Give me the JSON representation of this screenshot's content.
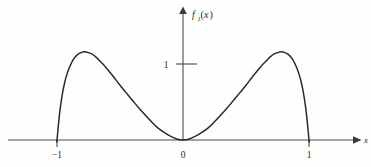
{
  "figure": {
    "y_axis_label": "f",
    "y_axis_label_subscript": "1",
    "y_axis_label_arg_open": "(",
    "y_axis_label_arg": "x",
    "y_axis_label_arg_close": ")",
    "x_axis_label": "x",
    "origin_label": "0",
    "x_tick_left_label": "−1",
    "x_tick_right_label": "1",
    "y_tick_label": "1",
    "curve_color": "#2b2b2b",
    "axis_color": "#4a4a4a",
    "background_color": "#fefefe"
  },
  "chart_data": {
    "type": "line",
    "title": "",
    "xlabel": "x",
    "ylabel": "f_1(x)",
    "grid": false,
    "legend": false,
    "xlim": [
      -1.35,
      1.35
    ],
    "ylim": [
      0,
      1.55
    ],
    "xticks": [
      -1,
      0,
      1
    ],
    "xticklabels": [
      "−1",
      "0",
      "1"
    ],
    "yticks": [
      1
    ],
    "yticklabels": [
      "1"
    ],
    "annotations": [],
    "series": [
      {
        "name": "f_1(x)",
        "comment": "Zero outside [-1,1]; vanishes at x=0 and rises to ~1.15 near x=+/-0.75; drops abruptly to 0 at x=+/-1",
        "x": [
          -1.35,
          -1.001,
          -1.0,
          -0.98,
          -0.96,
          -0.94,
          -0.92,
          -0.9,
          -0.87,
          -0.84,
          -0.81,
          -0.78,
          -0.75,
          -0.72,
          -0.69,
          -0.66,
          -0.63,
          -0.6,
          -0.55,
          -0.5,
          -0.45,
          -0.4,
          -0.35,
          -0.3,
          -0.25,
          -0.2,
          -0.15,
          -0.1,
          -0.05,
          0.0,
          0.05,
          0.1,
          0.15,
          0.2,
          0.25,
          0.3,
          0.35,
          0.4,
          0.45,
          0.5,
          0.55,
          0.6,
          0.63,
          0.66,
          0.69,
          0.72,
          0.75,
          0.78,
          0.81,
          0.84,
          0.87,
          0.9,
          0.92,
          0.94,
          0.96,
          0.98,
          1.0,
          1.001,
          1.35
        ],
        "y": [
          0.0,
          0.0,
          0.0,
          0.34,
          0.58,
          0.75,
          0.87,
          0.96,
          1.06,
          1.12,
          1.15,
          1.16,
          1.15,
          1.13,
          1.09,
          1.04,
          0.99,
          0.93,
          0.83,
          0.72,
          0.62,
          0.52,
          0.42,
          0.33,
          0.24,
          0.16,
          0.1,
          0.05,
          0.013,
          0.0,
          0.013,
          0.05,
          0.1,
          0.16,
          0.24,
          0.33,
          0.42,
          0.52,
          0.62,
          0.72,
          0.83,
          0.93,
          0.99,
          1.04,
          1.09,
          1.13,
          1.15,
          1.16,
          1.15,
          1.12,
          1.06,
          0.96,
          0.87,
          0.75,
          0.58,
          0.34,
          0.0,
          0.0,
          0.0
        ]
      }
    ]
  }
}
